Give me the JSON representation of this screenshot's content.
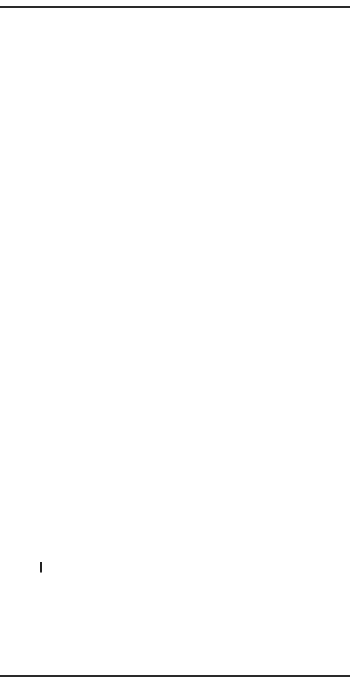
{
  "diagram": {
    "orientation": "rotated-90-ccw",
    "steps": [
      {
        "id": "infractions",
        "label": "Infractions\nat work\nor poor performance"
      },
      {
        "id": "investigate",
        "label": "Investigate any\nsignificant\npredisposing\nfactors"
      },
      {
        "id": "supervisor",
        "label": "Supervisor\nwarns\nworker"
      },
      {
        "id": "written",
        "label": "Written\nwarning"
      },
      {
        "id": "short",
        "label": "Short\nsuspension"
      },
      {
        "id": "longer",
        "label": "Longer\nsuspension"
      },
      {
        "id": "discharged",
        "label": "Discharged"
      }
    ],
    "inputs": [
      {
        "id": "potential",
        "label": "Potential\ndisciplinary\noffense or\nbehavior"
      },
      {
        "id": "second",
        "label": "Second\noffense"
      },
      {
        "id": "third",
        "label": "Third\noffense"
      },
      {
        "id": "fourth",
        "label": "Fourth\noffense"
      },
      {
        "id": "fifth",
        "label": "Fifth\noffense"
      }
    ],
    "brace_label": "Or failure to improve"
  }
}
